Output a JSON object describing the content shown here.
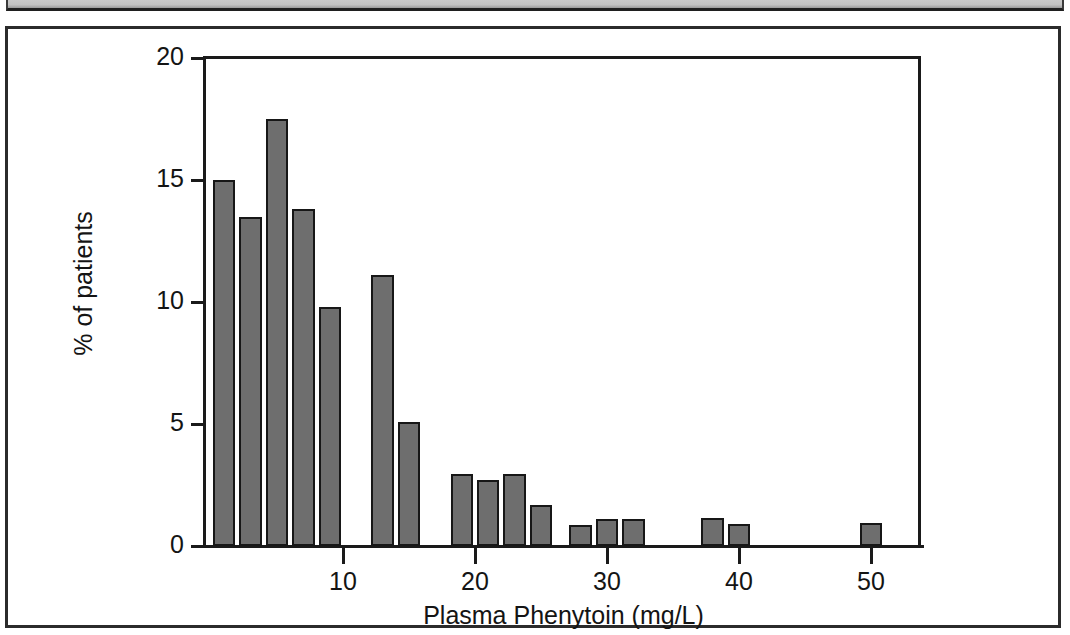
{
  "figure": {
    "kind": "scanned-figure",
    "border_color": "#2b2b2b",
    "background": "#ffffff"
  },
  "chart_data": {
    "type": "bar",
    "title": "",
    "subtitle": "",
    "xlabel": "Plasma Phenytoin (mg/L)",
    "ylabel": "% of patients",
    "xlim": [
      0,
      55
    ],
    "ylim": [
      0,
      20
    ],
    "grid": false,
    "legend": null,
    "bar_color": "#6e6e6e",
    "bar_edge_color": "#171717",
    "x_ticks": [
      10,
      20,
      30,
      40,
      50
    ],
    "x_tick_labels": [
      "10",
      "20",
      "30",
      "40",
      "50"
    ],
    "y_ticks": [
      0,
      5,
      10,
      15,
      20
    ],
    "y_tick_labels": [
      "0",
      "5",
      "10",
      "15",
      "20"
    ],
    "bin_width": 2,
    "x": [
      1,
      3,
      5,
      7,
      9,
      13,
      15,
      19,
      21,
      23,
      25,
      28,
      30,
      32,
      38,
      40,
      50
    ],
    "bins": [
      {
        "left": 0,
        "right": 2,
        "value": 15.0
      },
      {
        "left": 2,
        "right": 4,
        "value": 13.5
      },
      {
        "left": 4,
        "right": 6,
        "value": 17.5
      },
      {
        "left": 6,
        "right": 8,
        "value": 13.8
      },
      {
        "left": 8,
        "right": 10,
        "value": 9.8
      },
      {
        "left": 12,
        "right": 14,
        "value": 11.1
      },
      {
        "left": 14,
        "right": 16,
        "value": 5.1
      },
      {
        "left": 18,
        "right": 20,
        "value": 2.95
      },
      {
        "left": 20,
        "right": 22,
        "value": 2.7
      },
      {
        "left": 22,
        "right": 24,
        "value": 2.95
      },
      {
        "left": 24,
        "right": 26,
        "value": 1.7
      },
      {
        "left": 27,
        "right": 29,
        "value": 0.85
      },
      {
        "left": 29,
        "right": 31,
        "value": 1.1
      },
      {
        "left": 31,
        "right": 33,
        "value": 1.1
      },
      {
        "left": 37,
        "right": 39,
        "value": 1.15
      },
      {
        "left": 39,
        "right": 41,
        "value": 0.9
      },
      {
        "left": 49,
        "right": 51,
        "value": 0.95
      }
    ],
    "values": [
      15.0,
      13.5,
      17.5,
      13.8,
      9.8,
      11.1,
      5.1,
      2.95,
      2.7,
      2.95,
      1.7,
      0.85,
      1.1,
      1.1,
      1.15,
      0.9,
      0.95
    ],
    "categories": [
      "0-2",
      "2-4",
      "4-6",
      "6-8",
      "8-10",
      "12-14",
      "14-16",
      "18-20",
      "20-22",
      "22-24",
      "24-26",
      "27-29",
      "29-31",
      "31-33",
      "37-39",
      "39-41",
      "49-51"
    ]
  }
}
